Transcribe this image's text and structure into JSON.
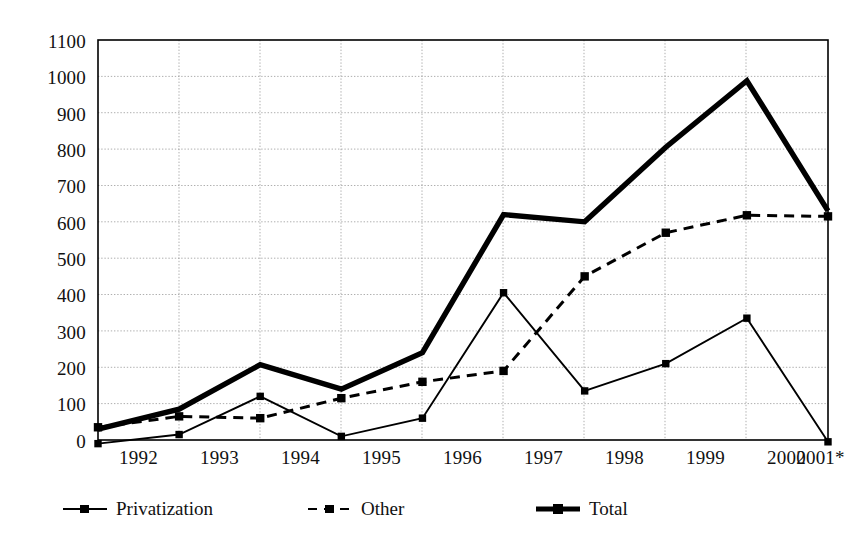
{
  "chart_data": {
    "type": "line",
    "title": "",
    "subtitle": "",
    "xlabel": "",
    "ylabel": "",
    "categories": [
      "1992",
      "1993",
      "1994",
      "1995",
      "1996",
      "1997",
      "1998",
      "1999",
      "2000",
      "2001*"
    ],
    "ylim": [
      0,
      1100
    ],
    "yticks": [
      0,
      100,
      200,
      300,
      400,
      500,
      600,
      700,
      800,
      900,
      1000,
      1100
    ],
    "ytick_labels": [
      "0",
      "100",
      "200",
      "300",
      "400",
      "500",
      "600",
      "700",
      "800",
      "900",
      "1000",
      "1100"
    ],
    "grid": true,
    "legend_position": "bottom",
    "series": [
      {
        "name": "Privatization",
        "style": "solid-thin",
        "marker": "square",
        "color": "#000000",
        "values": [
          -10,
          15,
          120,
          10,
          60,
          405,
          135,
          210,
          335,
          -5
        ]
      },
      {
        "name": "Other",
        "style": "dashed",
        "marker": "square",
        "color": "#000000",
        "values": [
          35,
          65,
          60,
          115,
          160,
          190,
          450,
          570,
          618,
          615
        ]
      },
      {
        "name": "Total",
        "style": "solid-thick",
        "marker": "none",
        "color": "#000000",
        "values": [
          30,
          85,
          207,
          140,
          240,
          620,
          600,
          805,
          988,
          630
        ]
      }
    ]
  },
  "legend": {
    "items": [
      {
        "label": "Privatization",
        "marker": "line-square-solid"
      },
      {
        "label": "Other",
        "marker": "line-square-dashed"
      },
      {
        "label": "Total",
        "marker": "line-thick-solid"
      }
    ]
  },
  "axes": {
    "y_tick_labels": [
      "1100",
      "1000",
      "900",
      "800",
      "700",
      "600",
      "500",
      "400",
      "300",
      "200",
      "100",
      "0"
    ],
    "x_tick_labels": [
      "1992",
      "1993",
      "1994",
      "1995",
      "1996",
      "1997",
      "1998",
      "1999",
      "2000",
      "2001*"
    ]
  }
}
